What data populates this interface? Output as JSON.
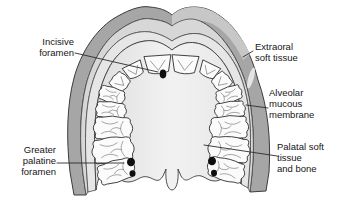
{
  "labels": {
    "incisive_foramen": "Incisive\nforamen",
    "extraoral_soft_tissue": "Extraoral\nsoft tissue",
    "alveolar_mucous_membrane": "Alveolar\nmucous\nmembrane",
    "greater_palatine_foramen": "Greater\npalatine\nforamen",
    "palatal_soft_tissue_and_bone": "Palatal soft\ntissue\nand bone"
  },
  "colors": {
    "background": "#ffffff",
    "extraoral_band": "#a6a6a6",
    "extraoral_band_highlight": "#c7c7c7",
    "specular_highlight": "#ececec",
    "submucosa_band": "#d7d7d7",
    "mucosa_band": "#e6e6e6",
    "palate_shade": "#dedede",
    "palate_light": "#f2f2f2",
    "tooth_fill": "#fbfbfb",
    "foramen_dot": "#0e0e0e",
    "outline": "#3c3c3c",
    "leader_line": "#2b2b2b",
    "label_text": "#161616"
  }
}
